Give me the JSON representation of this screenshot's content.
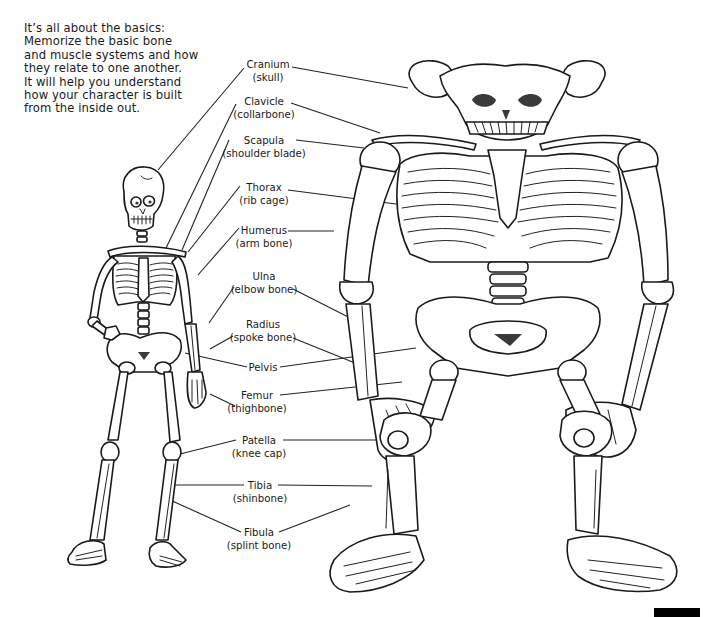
{
  "intro": {
    "lines": [
      "It’s all about the basics:",
      "Memorize the basic bone",
      "and muscle systems and how",
      "they relate to one another.",
      "It will help you understand",
      "how your character is built",
      "from the inside out."
    ]
  },
  "labels": [
    {
      "id": "cranium",
      "name": "Cranium",
      "common": "(skull)"
    },
    {
      "id": "clavicle",
      "name": "Clavicle",
      "common": "(collarbone)"
    },
    {
      "id": "scapula",
      "name": "Scapula",
      "common": "(shoulder blade)"
    },
    {
      "id": "thorax",
      "name": "Thorax",
      "common": "(rib cage)"
    },
    {
      "id": "humerus",
      "name": "Humerus",
      "common": "(arm bone)"
    },
    {
      "id": "ulna",
      "name": "Ulna",
      "common": "(elbow bone)"
    },
    {
      "id": "radius",
      "name": "Radius",
      "common": "(spoke bone)"
    },
    {
      "id": "pelvis",
      "name": "Pelvis",
      "common": ""
    },
    {
      "id": "femur",
      "name": "Femur",
      "common": "(thighbone)"
    },
    {
      "id": "patella",
      "name": "Patella",
      "common": "(knee cap)"
    },
    {
      "id": "tibia",
      "name": "Tibia",
      "common": "(shinbone)"
    },
    {
      "id": "fibula",
      "name": "Fibula",
      "common": "(splint bone)"
    }
  ],
  "figures": {
    "left": "human-skeleton",
    "right": "horned-monster-skeleton"
  },
  "colors": {
    "ink": "#1a1a1a",
    "paper": "#ffffff",
    "scale_bar": "#000000"
  }
}
